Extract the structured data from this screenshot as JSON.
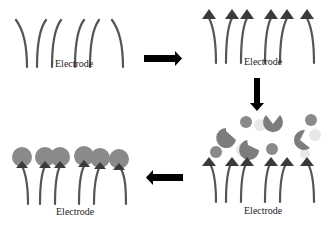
{
  "diagram": {
    "panels": [
      {
        "id": "bare-electrode",
        "label": "Electrode",
        "state": "bare probes"
      },
      {
        "id": "tagged-electrode",
        "label": "Electrode",
        "state": "probes with arrow-tip receptors"
      },
      {
        "id": "exposed-electrode",
        "label": "Electrode",
        "state": "probes exposed to mixed analytes"
      },
      {
        "id": "bound-electrode",
        "label": "Electrode",
        "state": "target analytes bound to receptors"
      }
    ],
    "arrows": [
      {
        "from": "bare-electrode",
        "to": "tagged-electrode",
        "direction": "right"
      },
      {
        "from": "tagged-electrode",
        "to": "exposed-electrode",
        "direction": "down"
      },
      {
        "from": "exposed-electrode",
        "to": "bound-electrode",
        "direction": "left"
      }
    ],
    "colors": {
      "probe": "#555555",
      "receptor": "#3a3a3a",
      "analyte_target": "#8a8a8a",
      "analyte_nontarget": "#e6e6e6",
      "arrow": "#000000"
    }
  }
}
